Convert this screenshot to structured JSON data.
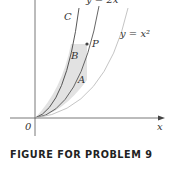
{
  "figure": {
    "caption": "FIGURE FOR PROBLEM 9",
    "curves": [
      {
        "name": "C",
        "label": "C"
      },
      {
        "name": "y=2x^2",
        "label": "y = 2x²"
      },
      {
        "name": "y=x^2",
        "label": "y = x²"
      }
    ],
    "regions": [
      {
        "name": "A",
        "label": "A"
      },
      {
        "name": "B",
        "label": "B"
      }
    ],
    "point": {
      "label": "P"
    },
    "axes": {
      "origin_label": "0",
      "x_label": "x"
    },
    "colors": {
      "shade": "#e2e2e2",
      "curve": "#444444",
      "light_curve": "#bdbdbd"
    }
  }
}
